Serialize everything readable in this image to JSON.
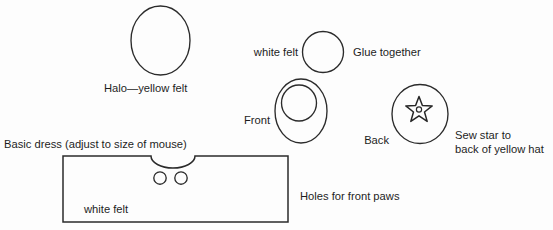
{
  "document": {
    "title": "Mouse angel costume pattern diagram",
    "background_color": "#fdfdfd",
    "ink_color": "#2b2b2b"
  },
  "labels": {
    "halo": "Halo—yellow felt",
    "white_felt_top": "white felt",
    "glue_together": "Glue together",
    "front": "Front",
    "back": "Back",
    "sew_star_line1": "Sew star to",
    "sew_star_line2": "back of yellow hat",
    "basic_dress": "Basic dress (adjust to size of mouse)",
    "white_felt_dress": "white felt",
    "holes_front_paws": "Holes for front paws"
  },
  "shapes": {
    "halo_ellipse": {
      "cx": 160.5,
      "cy": 40.5,
      "rx": 29.5,
      "ry": 34.5
    },
    "white_felt_circle": {
      "cx": 323,
      "cy": 52,
      "r": 20.5
    },
    "front_outer_ellipse": {
      "cx": 301,
      "cy": 111,
      "rx": 26,
      "ry": 32
    },
    "front_inner_ellipse": {
      "cx": 299,
      "cy": 103,
      "rx": 17.5,
      "ry": 18
    },
    "back_ellipse": {
      "cx": 420,
      "cy": 114,
      "rx": 28,
      "ry": 29.5
    },
    "star": {
      "cx": 419,
      "cy": 110,
      "outer_r": 13.5,
      "inner_r": 5.8,
      "center_dot_r": 2.6
    },
    "dress_box": {
      "x": 63,
      "y": 156,
      "width": 225,
      "height": 66
    },
    "dress_notch": {
      "cx": 173,
      "cy": 156,
      "rx": 22,
      "ry": 12
    },
    "paw_hole_left": {
      "cx": 160,
      "cy": 178,
      "r": 6.2
    },
    "paw_hole_right": {
      "cx": 181,
      "cy": 178,
      "r": 6.2
    }
  },
  "label_positions": {
    "halo": {
      "x": 104,
      "y": 92
    },
    "white_felt_top": {
      "x": 249,
      "y": 56
    },
    "glue_together": {
      "x": 353,
      "y": 56
    },
    "front": {
      "x": 235,
      "y": 124
    },
    "back": {
      "x": 366,
      "y": 144
    },
    "sew_star_line1": {
      "x": 455,
      "y": 139
    },
    "sew_star_line2": {
      "x": 455,
      "y": 153
    },
    "basic_dress": {
      "x": 4,
      "y": 148
    },
    "white_felt_dress": {
      "x": 84,
      "y": 213
    },
    "holes_front_paws": {
      "x": 300,
      "y": 200
    }
  }
}
